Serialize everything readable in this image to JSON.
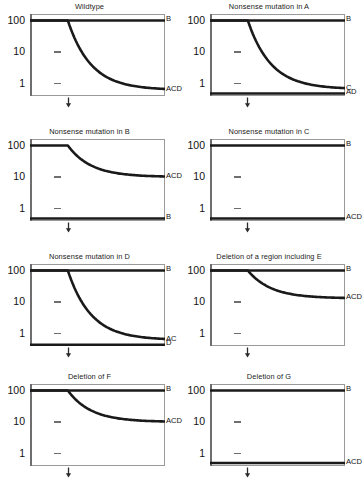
{
  "figure": {
    "type": "multi-panel-semilog-decay",
    "columns": 2,
    "rows": 4,
    "y_axis": {
      "scale": "log10",
      "ticks": [
        100,
        10,
        1
      ],
      "tick_labels": [
        "100",
        "10",
        "1"
      ],
      "ylim": [
        0.4,
        160
      ]
    },
    "x_axis": {
      "ticks": [],
      "arrow_marker_label": "",
      "arrow_position_fraction": 0.28
    },
    "line_color": "#1a1a1a"
  },
  "chart_data": {
    "type": "line",
    "title": "",
    "xlabel": "",
    "ylabel": "",
    "ylim": [
      0.4,
      160
    ],
    "yscale": "log",
    "yticks": [
      1,
      10,
      100
    ],
    "panels": [
      {
        "title": "Wildtype",
        "series": [
          {
            "name": "B",
            "label": "B",
            "shape": "flat",
            "start": 100,
            "end": 100
          },
          {
            "name": "ACD",
            "label": "ACD",
            "shape": "decay",
            "start": 100,
            "end": 0.62
          }
        ]
      },
      {
        "title": "Nonsense mutation in A",
        "series": [
          {
            "name": "B",
            "label": "B",
            "shape": "flat",
            "start": 100,
            "end": 100
          },
          {
            "name": "C",
            "label": "C",
            "shape": "decay",
            "start": 100,
            "end": 0.66
          },
          {
            "name": "AD",
            "label": "AD",
            "shape": "flat",
            "start": 0.48,
            "end": 0.48
          }
        ]
      },
      {
        "title": "Nonsense mutation in B",
        "series": [
          {
            "name": "ACD",
            "label": "ACD",
            "shape": "decay",
            "start": 100,
            "end": 10
          },
          {
            "name": "B",
            "label": "B",
            "shape": "flat",
            "start": 0.48,
            "end": 0.48
          }
        ]
      },
      {
        "title": "Nonsense mutation in C",
        "series": [
          {
            "name": "B",
            "label": "B",
            "shape": "flat",
            "start": 100,
            "end": 100
          },
          {
            "name": "ACD",
            "label": "ACD",
            "shape": "flat",
            "start": 0.48,
            "end": 0.48
          }
        ]
      },
      {
        "title": "Nonsense mutation in D",
        "series": [
          {
            "name": "B",
            "label": "B",
            "shape": "flat",
            "start": 100,
            "end": 100
          },
          {
            "name": "AC",
            "label": "AC",
            "shape": "decay",
            "start": 100,
            "end": 0.62
          },
          {
            "name": "D",
            "label": "D",
            "shape": "flat",
            "start": 0.44,
            "end": 0.44
          }
        ]
      },
      {
        "title": "Deletion of a region including E",
        "series": [
          {
            "name": "B",
            "label": "B",
            "shape": "flat",
            "start": 100,
            "end": 100
          },
          {
            "name": "ACD",
            "label": "ACD",
            "shape": "decay",
            "start": 100,
            "end": 13
          }
        ]
      },
      {
        "title": "Deletion of F",
        "series": [
          {
            "name": "B",
            "label": "B",
            "shape": "flat",
            "start": 100,
            "end": 100
          },
          {
            "name": "ACD",
            "label": "ACD",
            "shape": "decay",
            "start": 100,
            "end": 10
          }
        ]
      },
      {
        "title": "Deletion of G",
        "series": [
          {
            "name": "B",
            "label": "B",
            "shape": "flat",
            "start": 100,
            "end": 100
          },
          {
            "name": "ACD",
            "label": "ACD",
            "shape": "flat",
            "start": 0.5,
            "end": 0.5
          }
        ]
      }
    ]
  }
}
